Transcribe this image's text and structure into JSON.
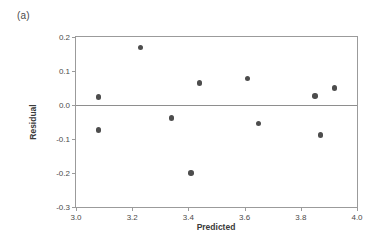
{
  "figure": {
    "panel_label": "(a)",
    "background_color": "#ffffff",
    "frame_color": "#9b9b9b",
    "marker_color": "#4d4d4d",
    "zero_line_color": "#8e8e8e"
  },
  "chart_data": {
    "type": "scatter",
    "title": "",
    "subtitle": "",
    "xlabel": "Predicted",
    "ylabel": "Residual",
    "xlim": [
      3.0,
      4.0
    ],
    "ylim": [
      -0.3,
      0.2
    ],
    "xticks": [
      3.0,
      3.2,
      3.4,
      3.6,
      3.8,
      4.0
    ],
    "yticks": [
      0.2,
      0.1,
      0.0,
      -0.1,
      -0.2,
      -0.3
    ],
    "xticklabels": [
      "3.0",
      "3.2",
      "3.4",
      "3.6",
      "3.8",
      "4.0"
    ],
    "yticklabels": [
      "0.2",
      "0.1",
      "0.0",
      "-0.1",
      "-0.2",
      "-0.3"
    ],
    "grid": false,
    "legend": null,
    "legend_position": "none",
    "reference_lines": [
      {
        "orientation": "horizontal",
        "value": 0.0,
        "style": "solid"
      }
    ],
    "series": [
      {
        "name": "residuals",
        "marker": "filled-circle",
        "points": [
          {
            "x": 3.08,
            "y": 0.024
          },
          {
            "x": 3.08,
            "y": -0.073
          },
          {
            "x": 3.23,
            "y": 0.169
          },
          {
            "x": 3.34,
            "y": -0.038
          },
          {
            "x": 3.41,
            "y": -0.2
          },
          {
            "x": 3.44,
            "y": 0.065
          },
          {
            "x": 3.61,
            "y": 0.078
          },
          {
            "x": 3.65,
            "y": -0.055
          },
          {
            "x": 3.85,
            "y": 0.027
          },
          {
            "x": 3.87,
            "y": -0.088
          },
          {
            "x": 3.92,
            "y": 0.05
          }
        ]
      }
    ]
  }
}
